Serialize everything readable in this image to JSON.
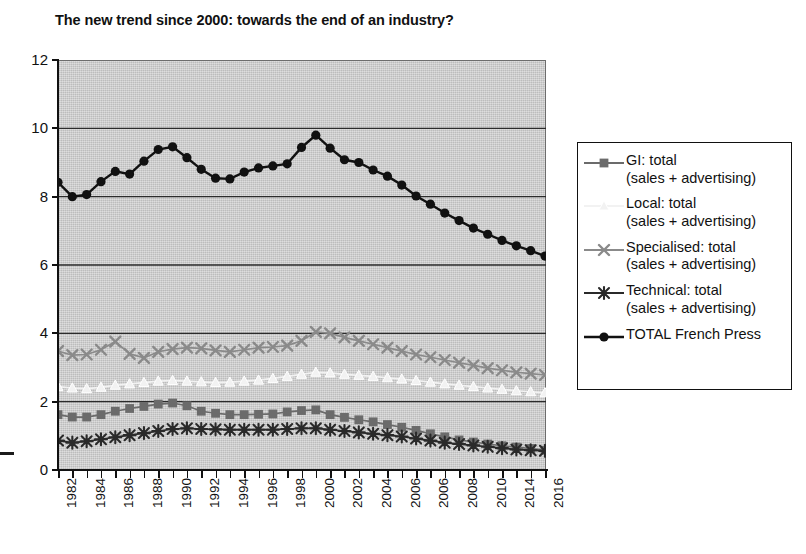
{
  "chart": {
    "title": "The new trend since 2000: towards the end of an industry?",
    "plot_bg_color": "#c9c9c9",
    "axis_color": "#111111",
    "gridline_color": "#2b2b2b"
  },
  "legend": {
    "items": [
      {
        "label_line1": "GI: total",
        "label_line2": "(sales + advertising)",
        "marker": "square-marker-icon",
        "color": "#6b6b6b"
      },
      {
        "label_line1": "Local: total",
        "label_line2": "(sales + advertising)",
        "marker": "triangle-marker-icon",
        "color": "#f2f2f2"
      },
      {
        "label_line1": "Specialised: total",
        "label_line2": "(sales + advertising)",
        "marker": "cross-marker-icon",
        "color": "#8a8a8a"
      },
      {
        "label_line1": "Technical: total",
        "label_line2": "(sales + advertising)",
        "marker": "asterisk-marker-icon",
        "color": "#2a2a2a"
      },
      {
        "label_line1": "TOTAL French Press",
        "label_line2": "",
        "marker": "circle-marker-icon",
        "color": "#111111"
      }
    ]
  },
  "chart_data": {
    "type": "line",
    "title": "The new trend since 2000: towards the end of an industry?",
    "xlabel": "",
    "ylabel": "",
    "ylim": [
      0,
      12
    ],
    "yticks": [
      0,
      2,
      4,
      6,
      8,
      10,
      12
    ],
    "grid": true,
    "legend_position": "right",
    "x": [
      1982,
      1983,
      1984,
      1985,
      1986,
      1987,
      1988,
      1989,
      1990,
      1991,
      1992,
      1993,
      1994,
      1995,
      1996,
      1997,
      1998,
      1999,
      2000,
      2001,
      2002,
      2003,
      2004,
      2005,
      2006,
      2007,
      2008,
      2009,
      2010,
      2011,
      2012,
      2013,
      2014,
      2015,
      2016
    ],
    "xtick_labels": [
      "1982",
      "",
      "1984",
      "",
      "1986",
      "",
      "1988",
      "",
      "1990",
      "",
      "1992",
      "",
      "1994",
      "",
      "1996",
      "",
      "1998",
      "",
      "2000",
      "",
      "2002",
      "",
      "2004",
      "",
      "2006",
      "",
      "2006",
      "",
      "2008",
      "",
      "2010",
      "",
      "2014",
      "",
      "2016"
    ],
    "series": [
      {
        "name": "GI: total (sales + advertising)",
        "color": "#6b6b6b",
        "marker": "square",
        "values": [
          1.62,
          1.55,
          1.55,
          1.62,
          1.72,
          1.8,
          1.86,
          1.93,
          1.96,
          1.88,
          1.72,
          1.66,
          1.62,
          1.62,
          1.63,
          1.64,
          1.7,
          1.74,
          1.76,
          1.62,
          1.54,
          1.47,
          1.41,
          1.33,
          1.25,
          1.16,
          1.06,
          0.97,
          0.88,
          0.82,
          0.76,
          0.71,
          0.67,
          0.63,
          0.58
        ]
      },
      {
        "name": "Local: total (sales + advertising)",
        "color": "#f2f2f2",
        "marker": "triangle",
        "values": [
          2.44,
          2.4,
          2.38,
          2.42,
          2.48,
          2.52,
          2.56,
          2.6,
          2.62,
          2.6,
          2.58,
          2.56,
          2.57,
          2.6,
          2.63,
          2.68,
          2.74,
          2.8,
          2.86,
          2.84,
          2.8,
          2.77,
          2.74,
          2.7,
          2.66,
          2.62,
          2.57,
          2.52,
          2.48,
          2.44,
          2.4,
          2.36,
          2.32,
          2.29,
          2.26
        ]
      },
      {
        "name": "Specialised: total (sales + advertising)",
        "color": "#8a8a8a",
        "marker": "cross",
        "values": [
          3.48,
          3.36,
          3.38,
          3.52,
          3.76,
          3.4,
          3.28,
          3.46,
          3.54,
          3.58,
          3.56,
          3.5,
          3.46,
          3.52,
          3.58,
          3.6,
          3.64,
          3.78,
          4.04,
          4.0,
          3.88,
          3.78,
          3.68,
          3.58,
          3.48,
          3.38,
          3.3,
          3.22,
          3.14,
          3.06,
          2.98,
          2.92,
          2.86,
          2.82,
          2.78
        ]
      },
      {
        "name": "Technical: total (sales + advertising)",
        "color": "#2a2a2a",
        "marker": "asterisk",
        "values": [
          0.86,
          0.8,
          0.84,
          0.9,
          0.96,
          1.02,
          1.08,
          1.14,
          1.2,
          1.22,
          1.2,
          1.19,
          1.18,
          1.18,
          1.18,
          1.18,
          1.2,
          1.22,
          1.22,
          1.18,
          1.14,
          1.1,
          1.06,
          1.02,
          0.98,
          0.92,
          0.86,
          0.8,
          0.76,
          0.72,
          0.68,
          0.64,
          0.6,
          0.58,
          0.56
        ]
      },
      {
        "name": "TOTAL French Press",
        "color": "#111111",
        "marker": "circle",
        "values": [
          8.42,
          8.0,
          8.06,
          8.44,
          8.74,
          8.66,
          9.04,
          9.38,
          9.46,
          9.14,
          8.8,
          8.54,
          8.52,
          8.72,
          8.84,
          8.9,
          8.96,
          9.44,
          9.8,
          9.42,
          9.08,
          9.0,
          8.78,
          8.6,
          8.34,
          8.02,
          7.78,
          7.52,
          7.3,
          7.08,
          6.9,
          6.72,
          6.56,
          6.42,
          6.26
        ]
      }
    ]
  }
}
